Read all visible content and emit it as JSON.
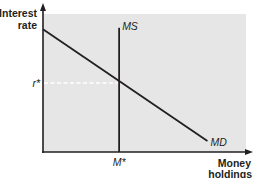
{
  "chart_data": {
    "type": "line",
    "title": "",
    "xlabel": "Money holdings",
    "ylabel": "Interest rate",
    "xlabel_lines": [
      "Money",
      "holdings"
    ],
    "ylabel_lines": [
      "Interest",
      "rate"
    ],
    "xlim": [
      0,
      10
    ],
    "ylim": [
      0,
      10
    ],
    "grid": false,
    "plot_background": "#e6e6e6",
    "line_color": "#231f20",
    "equilibrium": {
      "x": 3.75,
      "y": 5.0,
      "x_label": "M*",
      "y_label": "r*",
      "guide_color": "#ffffff"
    },
    "series": [
      {
        "name": "MD",
        "label": "MD",
        "kind": "demand",
        "points": [
          [
            0,
            8.9
          ],
          [
            8.1,
            0.8
          ]
        ]
      },
      {
        "name": "MS",
        "label": "MS",
        "kind": "supply-vertical",
        "points": [
          [
            3.75,
            0
          ],
          [
            3.75,
            9.0
          ]
        ]
      }
    ]
  }
}
